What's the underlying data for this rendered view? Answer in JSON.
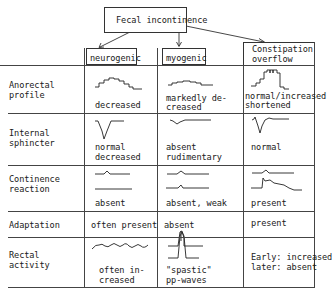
{
  "title": "Fecal incontinence",
  "columns": [
    {
      "key": "neurogenic",
      "label": "neurogenic"
    },
    {
      "key": "myogenic",
      "label": "myogenic"
    },
    {
      "key": "constipation",
      "label_line1": "Constipation",
      "label_line2": "overflow"
    }
  ],
  "rows": [
    {
      "label_line1": "Anorectal",
      "label_line2": "profile",
      "cells": [
        {
          "line1": "decreased",
          "waveform": "stepped-plateau-icon"
        },
        {
          "line1": "markedly de-",
          "line2": "creased",
          "waveform": "low-stepped-plateau-icon"
        },
        {
          "line1": "normal/increased",
          "line2": "shortened",
          "waveform": "high-narrow-plateau-icon"
        }
      ]
    },
    {
      "label_line1": "Internal",
      "label_line2": "sphincter",
      "cells": [
        {
          "line1": "normal",
          "line2": "decreased",
          "waveform": "relaxation-dip-icon"
        },
        {
          "line1": "absent",
          "line2": "rudimentary",
          "waveform": "shallow-dip-icon"
        },
        {
          "line1": "normal",
          "waveform": "spike-dip-icon"
        }
      ]
    },
    {
      "label_line1": "Continence",
      "label_line2": "reaction",
      "cells": [
        {
          "line1": "absent",
          "waveform": "flat-trace-icon"
        },
        {
          "line1": "absent, weak",
          "waveform": "weak-bump-trace-icon"
        },
        {
          "line1": "present",
          "waveform": "contraction-trace-icon"
        }
      ]
    },
    {
      "label_line1": "Adaptation",
      "cells": [
        {
          "line1": "often present"
        },
        {
          "line1": "absent"
        },
        {
          "line1": "present"
        }
      ]
    },
    {
      "label_line1": "Rectal",
      "label_line2": "activity",
      "cells": [
        {
          "line1": "often in-",
          "line2": "creased",
          "waveform": "wavy-trace-icon"
        },
        {
          "line1": "\"spastic\"",
          "line2": "pp-waves",
          "waveform": "spastic-peak-icon"
        },
        {
          "line1": "Early: increased",
          "line2": "later: absent"
        }
      ]
    }
  ]
}
